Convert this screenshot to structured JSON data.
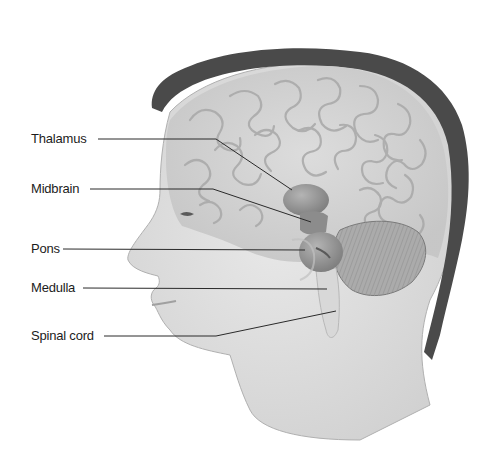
{
  "diagram": {
    "labels": [
      {
        "id": "thalamus",
        "text": "Thalamus",
        "x": 31,
        "y": 132
      },
      {
        "id": "midbrain",
        "text": "Midbrain",
        "x": 31,
        "y": 181
      },
      {
        "id": "pons",
        "text": "Pons",
        "x": 31,
        "y": 241
      },
      {
        "id": "medulla",
        "text": "Medulla",
        "x": 31,
        "y": 279
      },
      {
        "id": "spinal-cord",
        "text": "Spinal cord",
        "x": 31,
        "y": 328
      }
    ]
  },
  "colors": {
    "hair": "#4a4a4a",
    "skin": "#e2e2e2",
    "brain": "#d2d2d2",
    "brain_folds": "#a8a8a8",
    "thalamus": "#9a9a9a",
    "cerebellum": "#a6a6a6",
    "leader_line": "#2a2a2a",
    "label_text": "#1c1c1c"
  }
}
